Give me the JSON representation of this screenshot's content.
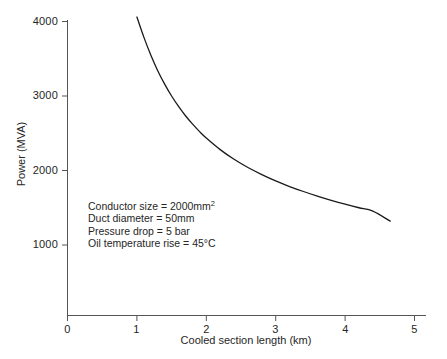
{
  "chart_data": {
    "type": "line",
    "title": "",
    "xlabel": "Cooled section length (km)",
    "ylabel": "Power (MVA)",
    "xlim": [
      0,
      5.15
    ],
    "ylim": [
      0,
      4100
    ],
    "xticks": [
      0,
      1,
      2,
      3,
      4,
      5
    ],
    "xtick_labels": [
      "0",
      "1",
      "2",
      "3",
      "4",
      "5"
    ],
    "yticks": [
      1000,
      2000,
      3000,
      4000
    ],
    "ytick_labels": [
      "1000",
      "2000",
      "3000",
      "4000"
    ],
    "grid": false,
    "legend": "none",
    "series": [
      {
        "name": "Power vs cooled section length",
        "color": "#1a1a1a",
        "x": [
          1.0,
          1.1,
          1.2,
          1.3,
          1.4,
          1.5,
          1.6,
          1.7,
          1.8,
          1.9,
          2.0,
          2.2,
          2.4,
          2.6,
          2.8,
          3.0,
          3.2,
          3.4,
          3.6,
          3.8,
          4.0,
          4.2,
          4.4,
          4.65
        ],
        "y": [
          4060,
          3790,
          3550,
          3340,
          3160,
          3000,
          2860,
          2735,
          2625,
          2525,
          2435,
          2280,
          2150,
          2040,
          1945,
          1860,
          1785,
          1718,
          1656,
          1600,
          1548,
          1500,
          1455,
          1320
        ]
      }
    ],
    "annotations": [
      "Conductor size  =  2000mm2",
      "Duct diameter  =  50mm",
      "Pressure drop  =  5 bar",
      "Oil temperature rise  =  45°C"
    ]
  },
  "annotation_lines": {
    "line1_prefix": "Conductor size  =  2000mm",
    "line1_sup": "2",
    "line2": "Duct diameter  =  50mm",
    "line3": "Pressure drop  =  5 bar",
    "line4": "Oil temperature rise  =  45°C"
  },
  "axes": {
    "x_title": "Cooled section length (km)",
    "y_title": "Power (MVA)",
    "axis_color": "#4a4a4a"
  },
  "ticks": {
    "x": [
      "0",
      "1",
      "2",
      "3",
      "4",
      "5"
    ],
    "y": [
      "4000",
      "3000",
      "2000",
      "1000"
    ]
  }
}
